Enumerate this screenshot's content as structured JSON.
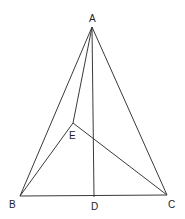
{
  "diagram": {
    "points": {
      "A": {
        "label": "A",
        "x": 92,
        "y": 27,
        "lx": 89,
        "ly": 22
      },
      "B": {
        "label": "B",
        "x": 20,
        "y": 196,
        "lx": 9,
        "ly": 208
      },
      "C": {
        "label": "C",
        "x": 167,
        "y": 195,
        "lx": 168,
        "ly": 208
      },
      "D": {
        "label": "D",
        "x": 94,
        "y": 197,
        "lx": 91,
        "ly": 210
      },
      "E": {
        "label": "E",
        "x": 73,
        "y": 123,
        "lx": 69,
        "ly": 139
      }
    },
    "segments": [
      [
        "A",
        "B"
      ],
      [
        "A",
        "C"
      ],
      [
        "B",
        "C"
      ],
      [
        "A",
        "D"
      ],
      [
        "A",
        "E"
      ],
      [
        "B",
        "E"
      ],
      [
        "E",
        "C"
      ]
    ],
    "stroke_color": "#3a3a3a"
  }
}
